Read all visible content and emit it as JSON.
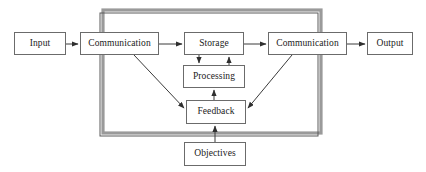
{
  "diagram": {
    "type": "block-flow-diagram",
    "colors": {
      "box_border": "#6b6b6b",
      "box_fill": "#ffffff",
      "text": "#1a1a1a",
      "arrow": "#3a3a3a",
      "outer_frame": "#5a5a5a",
      "frame_shadow": "#9a9a9a",
      "background": "#ffffff"
    },
    "nodes": [
      {
        "id": "input",
        "label": "Input",
        "x": 14,
        "y": 32,
        "w": 52,
        "h": 23
      },
      {
        "id": "communication_in",
        "label": "Communication",
        "x": 80,
        "y": 32,
        "w": 79,
        "h": 23
      },
      {
        "id": "storage",
        "label": "Storage",
        "x": 184,
        "y": 32,
        "w": 60,
        "h": 23
      },
      {
        "id": "communication_out",
        "label": "Communication",
        "x": 268,
        "y": 32,
        "w": 79,
        "h": 23
      },
      {
        "id": "output",
        "label": "Output",
        "x": 367,
        "y": 32,
        "w": 46,
        "h": 23
      },
      {
        "id": "processing",
        "label": "Processing",
        "x": 183,
        "y": 65,
        "w": 62,
        "h": 23
      },
      {
        "id": "feedback",
        "label": "Feedback",
        "x": 186,
        "y": 100,
        "w": 60,
        "h": 24
      },
      {
        "id": "objectives",
        "label": "Objectives",
        "x": 184,
        "y": 142,
        "w": 62,
        "h": 24
      }
    ],
    "outer_frame": {
      "x": 100,
      "y": 13,
      "w": 218,
      "h": 123,
      "shadow_offset_x": 3,
      "shadow_offset_y": -3
    },
    "edges": [
      {
        "id": "input-to-communication-in",
        "from": "input",
        "to": "communication_in",
        "kind": "horizontal-arrow"
      },
      {
        "id": "communication-in-to-storage",
        "from": "communication_in",
        "to": "storage",
        "kind": "horizontal-arrow"
      },
      {
        "id": "storage-to-communication-out",
        "from": "storage",
        "to": "communication_out",
        "kind": "horizontal-arrow"
      },
      {
        "id": "communication-out-to-output",
        "from": "communication_out",
        "to": "output",
        "kind": "horizontal-arrow"
      },
      {
        "id": "storage-to-processing",
        "from": "storage",
        "to": "processing",
        "kind": "vertical-arrow-down"
      },
      {
        "id": "processing-to-storage",
        "from": "processing",
        "to": "storage",
        "kind": "vertical-arrow-up"
      },
      {
        "id": "feedback-to-processing",
        "from": "feedback",
        "to": "processing",
        "kind": "vertical-arrow-up"
      },
      {
        "id": "communication-in-to-feedback",
        "from": "communication_in",
        "to": "feedback",
        "kind": "diagonal-arrow"
      },
      {
        "id": "communication-out-to-feedback",
        "from": "communication_out",
        "to": "feedback",
        "kind": "diagonal-arrow"
      },
      {
        "id": "objectives-to-feedback",
        "from": "objectives",
        "to": "feedback",
        "kind": "vertical-arrow-up"
      }
    ]
  }
}
